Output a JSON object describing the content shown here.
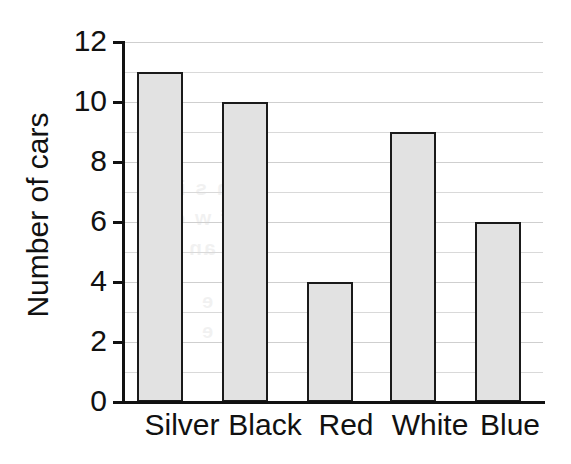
{
  "chart_data": {
    "type": "bar",
    "title": "",
    "subtitle": "",
    "xlabel": "",
    "ylabel": "Number of cars",
    "categories": [
      "Silver",
      "Black",
      "Red",
      "White",
      "Blue"
    ],
    "values": [
      11,
      10,
      4,
      9,
      6
    ],
    "series": [
      {
        "name": "Number of cars",
        "values": [
          11,
          10,
          4,
          9,
          6
        ]
      }
    ],
    "ylim": [
      0,
      12
    ],
    "xlim": null,
    "y_ticks": [
      0,
      2,
      4,
      6,
      8,
      10,
      12
    ],
    "y_tick_labels": [
      "0",
      "2",
      "4",
      "6",
      "8",
      "10",
      "12"
    ],
    "y_minor_gridlines": [
      1,
      3,
      5,
      7,
      9,
      11
    ],
    "grid": true,
    "grid_axis": "y",
    "grid_interval": 1,
    "legend": false,
    "legend_position": "none",
    "bar_fill_color": "#e2e2e2",
    "bar_edge_color": "#1a1a1a",
    "axis_color": "#111111",
    "gridline_color": "#d9d9d9",
    "background_color": "#ffffff",
    "annotations": []
  },
  "ghost_text": {
    "line1": "nt n s ion",
    "line2": "ri  f w c s",
    "line3": "an 00",
    "line4": "f e",
    "line5": "Ch e"
  }
}
